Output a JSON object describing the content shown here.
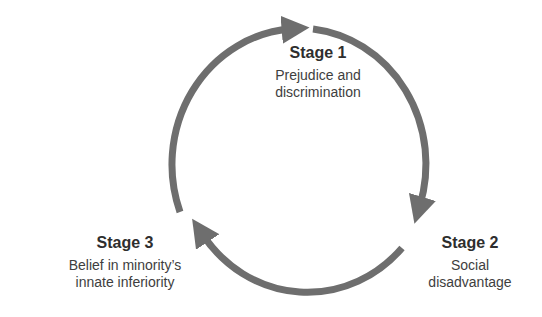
{
  "diagram": {
    "type": "cycle",
    "arrow_color": "#6e6e6e",
    "stages": [
      {
        "title": "Stage 1",
        "description_line1": "Prejudice and",
        "description_line2": "discrimination"
      },
      {
        "title": "Stage 2",
        "description_line1": "Social",
        "description_line2": "disadvantage"
      },
      {
        "title": "Stage 3",
        "description_line1": "Belief in minority’s",
        "description_line2": "innate inferiority"
      }
    ],
    "flow": [
      "Stage 1",
      "Stage 2",
      "Stage 3",
      "Stage 1"
    ]
  }
}
